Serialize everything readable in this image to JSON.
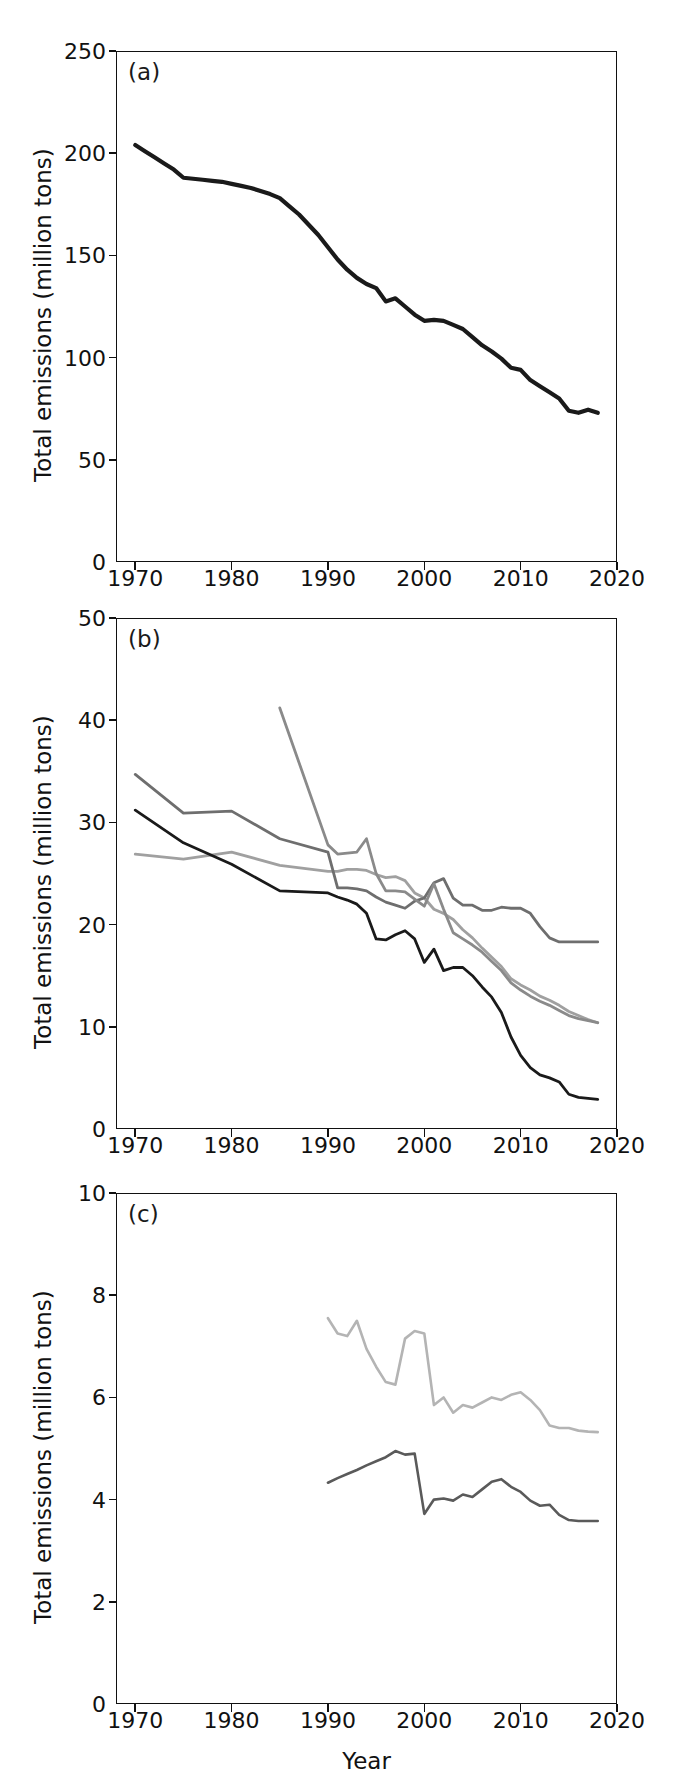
{
  "figure": {
    "xlabel": "Year",
    "ylabel": "Total emissions (million tons)",
    "colors": {
      "black": "#1a1a1a",
      "dark_gray": "#4d4d4d",
      "mid_gray": "#6e6e6e",
      "gray": "#8a8a8a",
      "light_gray": "#b4b4b4"
    }
  },
  "chart_data": [
    {
      "type": "line",
      "panel": "a",
      "title": "",
      "xlabel": "",
      "ylabel": "Total emissions (million tons)",
      "xlim": [
        1968,
        2020
      ],
      "ylim": [
        0,
        250
      ],
      "xticks": [
        1970,
        1980,
        1990,
        2000,
        2010,
        2020
      ],
      "yticks": [
        0,
        50,
        100,
        150,
        200,
        250
      ],
      "grid": false,
      "legend_position": "upper right",
      "series": [
        {
          "name": "CO",
          "color": "#1a1a1a",
          "x": [
            1970,
            1971,
            1972,
            1973,
            1974,
            1975,
            1976,
            1977,
            1978,
            1979,
            1980,
            1981,
            1982,
            1983,
            1984,
            1985,
            1986,
            1987,
            1988,
            1989,
            1990,
            1991,
            1992,
            1993,
            1994,
            1995,
            1996,
            1997,
            1998,
            1999,
            2000,
            2001,
            2002,
            2003,
            2004,
            2005,
            2006,
            2007,
            2008,
            2009,
            2010,
            2011,
            2012,
            2013,
            2014,
            2015,
            2016,
            2017,
            2018
          ],
          "values": [
            204,
            201,
            198,
            195,
            192,
            188,
            187.5,
            187,
            186.5,
            186,
            185,
            184,
            183,
            181.5,
            180,
            178,
            174,
            170,
            165,
            160,
            154,
            148,
            143,
            139,
            136,
            134,
            127.5,
            129,
            125,
            121,
            118,
            118.5,
            118,
            116,
            114,
            110,
            106,
            103,
            99.5,
            95,
            94,
            89,
            86,
            83,
            80,
            74,
            73,
            74.5,
            73,
            70.5,
            68,
            65,
            62,
            59
          ]
        }
      ]
    },
    {
      "type": "line",
      "panel": "b",
      "title": "",
      "xlabel": "",
      "ylabel": "Total emissions (million tons)",
      "xlim": [
        1968,
        2020
      ],
      "ylim": [
        0,
        50
      ],
      "xticks": [
        1970,
        1980,
        1990,
        2000,
        2010,
        2020
      ],
      "yticks": [
        0,
        10,
        20,
        30,
        40,
        50
      ],
      "grid": false,
      "legend_position": "upper right",
      "series": [
        {
          "name": "NOx",
          "label_html": "NO<sub>x</sub>",
          "color": "#a0a0a0",
          "x": [
            1970,
            1975,
            1980,
            1985,
            1990,
            1991,
            1992,
            1993,
            1994,
            1995,
            1996,
            1997,
            1998,
            1999,
            2000,
            2001,
            2002,
            2003,
            2004,
            2005,
            2006,
            2007,
            2008,
            2009,
            2010,
            2011,
            2012,
            2013,
            2014,
            2015,
            2016,
            2017,
            2018
          ],
          "values": [
            26.9,
            26.4,
            27.1,
            25.8,
            25.2,
            25.2,
            25.4,
            25.4,
            25.3,
            24.9,
            24.6,
            24.7,
            24.3,
            23.1,
            22.6,
            21.5,
            21.1,
            20.5,
            19.5,
            18.7,
            17.7,
            16.8,
            15.9,
            14.7,
            14.1,
            13.6,
            13.0,
            12.6,
            12.1,
            11.5,
            11.1,
            10.7,
            10.4
          ]
        },
        {
          "name": "PM10",
          "label_html": "PM<sub>10</sub>",
          "color": "#6e6e6e",
          "x": [
            1970,
            1975,
            1980,
            1985,
            1990,
            1991,
            1992,
            1993,
            1994,
            1995,
            1996,
            1997,
            1998,
            1999,
            2000,
            2001,
            2002,
            2003,
            2004,
            2005,
            2006,
            2007,
            2008,
            2009,
            2010,
            2011,
            2012,
            2013,
            2014,
            2015,
            2016,
            2017,
            2018
          ],
          "values": [
            34.7,
            30.9,
            31.1,
            28.4,
            27.1,
            23.6,
            23.6,
            23.5,
            23.3,
            22.7,
            22.2,
            21.9,
            21.6,
            22.3,
            22.6,
            24.1,
            24.5,
            22.6,
            21.9,
            21.9,
            21.4,
            21.4,
            21.7,
            21.6,
            21.6,
            21.1,
            19.8,
            18.7,
            18.3,
            18.3,
            18.3,
            18.3,
            18.3
          ]
        },
        {
          "name": "SO2",
          "label_html": "SO<sub>2</sub>",
          "color": "#1a1a1a",
          "x": [
            1970,
            1975,
            1980,
            1985,
            1990,
            1991,
            1992,
            1993,
            1994,
            1995,
            1996,
            1997,
            1998,
            1999,
            2000,
            2001,
            2002,
            2003,
            2004,
            2005,
            2006,
            2007,
            2008,
            2009,
            2010,
            2011,
            2012,
            2013,
            2014,
            2015,
            2016,
            2017,
            2018
          ],
          "values": [
            31.2,
            28.0,
            25.9,
            23.3,
            23.1,
            22.7,
            22.4,
            22.0,
            21.1,
            18.6,
            18.5,
            19.0,
            19.4,
            18.6,
            16.3,
            17.6,
            15.5,
            15.8,
            15.8,
            15.0,
            13.9,
            12.9,
            11.4,
            9.0,
            7.2,
            6.0,
            5.3,
            5.0,
            4.6,
            3.4,
            3.1,
            3.0,
            2.9
          ]
        },
        {
          "name": "VOCs",
          "label_html": "VOCs",
          "color": "#8a8a8a",
          "x": [
            1985,
            1990,
            1991,
            1992,
            1993,
            1994,
            1995,
            1996,
            1997,
            1998,
            1999,
            2000,
            2001,
            2002,
            2003,
            2004,
            2005,
            2006,
            2007,
            2008,
            2009,
            2010,
            2011,
            2012,
            2013,
            2014,
            2015,
            2016,
            2017,
            2018
          ],
          "values": [
            41.2,
            27.8,
            26.9,
            27.0,
            27.1,
            28.4,
            25.0,
            23.3,
            23.3,
            23.2,
            22.5,
            21.8,
            24.0,
            21.5,
            19.2,
            18.6,
            18.0,
            17.3,
            16.4,
            15.5,
            14.3,
            13.6,
            13.0,
            12.5,
            12.1,
            11.6,
            11.1,
            10.8,
            10.6,
            10.4
          ]
        }
      ]
    },
    {
      "type": "line",
      "panel": "c",
      "title": "",
      "xlabel": "Year",
      "ylabel": "Total emissions (million tons)",
      "xlim": [
        1968,
        2020
      ],
      "ylim": [
        0,
        10
      ],
      "xticks": [
        1970,
        1980,
        1990,
        2000,
        2010,
        2020
      ],
      "yticks": [
        0,
        2,
        4,
        6,
        8,
        10
      ],
      "grid": false,
      "legend_position": "upper right",
      "series": [
        {
          "name": "PM2.5",
          "label_html": "PM<sub>2.5</sub>",
          "color": "#b4b4b4",
          "x": [
            1990,
            1991,
            1992,
            1993,
            1994,
            1995,
            1996,
            1997,
            1998,
            1999,
            2000,
            2001,
            2002,
            2003,
            2004,
            2005,
            2006,
            2007,
            2008,
            2009,
            2010,
            2011,
            2012,
            2013,
            2014,
            2015,
            2016,
            2017,
            2018
          ],
          "values": [
            7.55,
            7.25,
            7.2,
            7.5,
            6.95,
            6.6,
            6.3,
            6.25,
            7.15,
            7.3,
            7.25,
            5.85,
            6.0,
            5.7,
            5.85,
            5.8,
            5.9,
            6.0,
            5.95,
            6.05,
            6.1,
            5.95,
            5.75,
            5.45,
            5.4,
            5.4,
            5.35,
            5.33,
            5.32
          ]
        },
        {
          "name": "NH3",
          "label_html": "NH<sub>3</sub>",
          "color": "#5a5a5a",
          "x": [
            1990,
            1991,
            1992,
            1993,
            1994,
            1995,
            1996,
            1997,
            1998,
            1999,
            2000,
            2001,
            2002,
            2003,
            2004,
            2005,
            2006,
            2007,
            2008,
            2009,
            2010,
            2011,
            2012,
            2013,
            2014,
            2015,
            2016,
            2017,
            2018
          ],
          "values": [
            4.33,
            4.42,
            4.5,
            4.58,
            4.67,
            4.75,
            4.83,
            4.95,
            4.88,
            4.9,
            3.72,
            4.0,
            4.02,
            3.98,
            4.1,
            4.05,
            4.2,
            4.35,
            4.4,
            4.25,
            4.15,
            3.98,
            3.88,
            3.9,
            3.7,
            3.6,
            3.58,
            3.58,
            3.58
          ]
        }
      ]
    }
  ],
  "panels": {
    "a": {
      "label": "(a)",
      "yticks": [
        "0",
        "50",
        "100",
        "150",
        "200",
        "250"
      ],
      "xticks": [
        "1970",
        "1980",
        "1990",
        "2000",
        "2010",
        "2020"
      ],
      "legend": [
        {
          "name": "CO",
          "color": "#1a1a1a"
        }
      ]
    },
    "b": {
      "label": "(b)",
      "yticks": [
        "0",
        "10",
        "20",
        "30",
        "40",
        "50"
      ],
      "xticks": [
        "1970",
        "1980",
        "1990",
        "2000",
        "2010",
        "2020"
      ],
      "legend": [
        {
          "name": "NOx",
          "base": "NO",
          "sub": "x",
          "color": "#a0a0a0"
        },
        {
          "name": "PM10",
          "base": "PM",
          "sub": "10",
          "color": "#6e6e6e"
        },
        {
          "name": "SO2",
          "base": "SO",
          "sub": "2",
          "color": "#1a1a1a"
        },
        {
          "name": "VOCs",
          "base": "VOCs",
          "sub": "",
          "color": "#8a8a8a"
        }
      ]
    },
    "c": {
      "label": "(c)",
      "yticks": [
        "0",
        "2",
        "4",
        "6",
        "8",
        "10"
      ],
      "xticks": [
        "1970",
        "1980",
        "1990",
        "2000",
        "2010",
        "2020"
      ],
      "legend": [
        {
          "name": "PM2.5",
          "base": "PM",
          "sub": "2.5",
          "color": "#b4b4b4"
        },
        {
          "name": "NH3",
          "base": "NH",
          "sub": "3",
          "color": "#5a5a5a"
        }
      ]
    }
  }
}
